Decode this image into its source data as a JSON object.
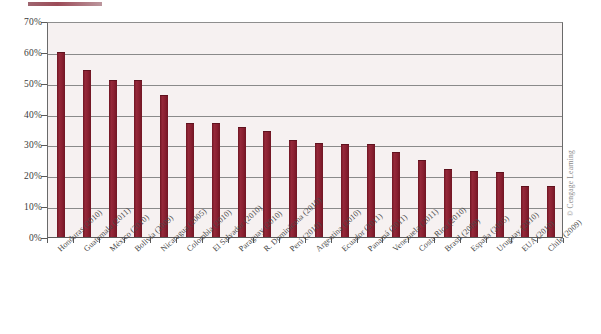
{
  "credit": "© Cengage Learning",
  "chart_data": {
    "type": "bar",
    "title": "",
    "subtitle": "",
    "xlabel": "",
    "ylabel": "",
    "ylim": [
      0,
      70
    ],
    "ytick_labels": [
      "70%",
      "60%",
      "50%",
      "40%",
      "30%",
      "20%",
      "10%",
      "0%"
    ],
    "ytick_values": [
      70,
      60,
      50,
      40,
      30,
      20,
      10,
      0
    ],
    "grid": true,
    "legend": "none",
    "bar_color": "#8c2232",
    "plot_background": "#f6f1f1",
    "categories": [
      "Honduras (2010)",
      "Guatemala (2011)",
      "México (2010)",
      "Bolivia (2009)",
      "Nicaragua (2005)",
      "Colombia (2010)",
      "El Salvador (2010)",
      "Paraguay (2010)",
      "R. Dominicana (2010)",
      "Perú (2010)",
      "Argentina (2010)",
      "Ecuador (2011)",
      "Panamá (2011)",
      "Venezuela (2011)",
      "Costa Rica (2010)",
      "Brasil (2009)",
      "España (2005)",
      "Uruguay (2010)",
      "EUA (2010)",
      "Chile (2009)"
    ],
    "values": [
      60,
      54,
      51,
      51,
      46,
      37,
      37,
      35.5,
      34.5,
      31.5,
      30.5,
      30,
      30,
      27.5,
      25,
      22,
      21.5,
      21,
      16.5,
      16.5
    ]
  }
}
